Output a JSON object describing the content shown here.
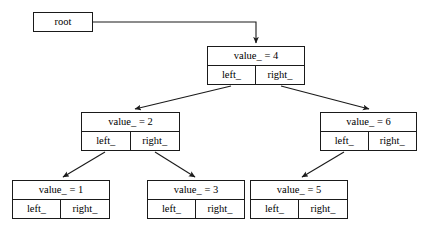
{
  "diagram": {
    "background_color": "#ffffff",
    "line_color": "#1a1a1a",
    "text_color": "#000000",
    "width": 427,
    "height": 238
  },
  "root_pointer": {
    "label": "root",
    "x": 33,
    "y": 12,
    "w": 60,
    "h": 20
  },
  "nodes": [
    {
      "id": "n4",
      "value_label": "value_  = 4",
      "left_label": "left_",
      "right_label": "right_",
      "x": 207,
      "y": 46,
      "w": 98,
      "h": 39
    },
    {
      "id": "n2",
      "value_label": "value_  = 2",
      "left_label": "left_",
      "right_label": "right_",
      "x": 81,
      "y": 112,
      "w": 99,
      "h": 39
    },
    {
      "id": "n6",
      "value_label": "value_  = 6",
      "left_label": "left_",
      "right_label": "right_",
      "x": 320,
      "y": 112,
      "w": 97,
      "h": 39
    },
    {
      "id": "n1",
      "value_label": "value_  = 1",
      "left_label": "left_",
      "right_label": "right_",
      "x": 12,
      "y": 180,
      "w": 98,
      "h": 39
    },
    {
      "id": "n3",
      "value_label": "value_  = 3",
      "left_label": "left_",
      "right_label": "right_",
      "x": 147,
      "y": 180,
      "w": 98,
      "h": 39
    },
    {
      "id": "n5",
      "value_label": "value_  = 5",
      "left_label": "left_",
      "right_label": "right_",
      "x": 250,
      "y": 180,
      "w": 98,
      "h": 39
    }
  ],
  "edges": [
    {
      "id": "root-to-n4",
      "from": "root",
      "to": "n4",
      "kind": "elbow",
      "points": "93,22 256,22 256,44"
    },
    {
      "id": "n4-left-to-n2",
      "from": "n4.left_",
      "to": "n2",
      "kind": "diagonal",
      "points": "231,86 134,110"
    },
    {
      "id": "n4-right-to-n6",
      "from": "n4.right_",
      "to": "n6",
      "kind": "diagonal",
      "points": "281,86 370,110"
    },
    {
      "id": "n2-left-to-n1",
      "from": "n2.left_",
      "to": "n1",
      "kind": "diagonal",
      "points": "105,152 62,178"
    },
    {
      "id": "n2-right-to-n3",
      "from": "n2.right_",
      "to": "n3",
      "kind": "diagonal",
      "points": "155,152 196,178"
    },
    {
      "id": "n6-left-to-n5",
      "from": "n6.left_",
      "to": "n5",
      "kind": "diagonal",
      "points": "344,152 301,178"
    }
  ]
}
